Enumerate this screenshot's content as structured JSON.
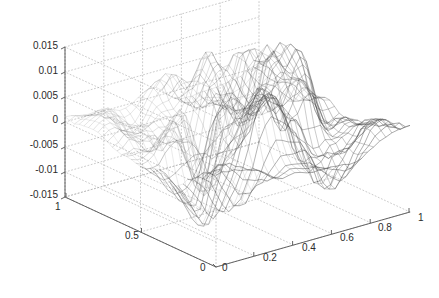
{
  "figure": {
    "background_color": "#ffffff",
    "width": 439,
    "height": 298,
    "title": ""
  },
  "axes": {
    "box_color": "#555555",
    "grid_color": "#b4b4b4",
    "grid_style": "dotted",
    "mesh_color": "#777777",
    "mesh_dark_color": "#333333"
  },
  "chart_data": {
    "type": "surface",
    "render": "mesh-wireframe",
    "title": "",
    "xlabel": "",
    "ylabel": "",
    "zlabel": "",
    "grid": true,
    "legend": null,
    "view": {
      "azimuth": -37.5,
      "elevation": 30
    },
    "xlim": [
      0,
      1
    ],
    "ylim": [
      0,
      1
    ],
    "zlim": [
      -0.015,
      0.015
    ],
    "xticks": [
      "0",
      "0.2",
      "0.4",
      "0.6",
      "0.8",
      "1"
    ],
    "xtick_values": [
      0,
      0.2,
      0.4,
      0.6,
      0.8,
      1
    ],
    "yticks": [
      "0",
      "0.5",
      "1"
    ],
    "ytick_values": [
      0,
      0.5,
      1
    ],
    "zticks": [
      "0.015",
      "0.01",
      "0.005",
      "0",
      "-0.005",
      "-0.01",
      "-0.015"
    ],
    "ztick_values": [
      0.015,
      0.01,
      0.005,
      0,
      -0.005,
      -0.01,
      -0.015
    ],
    "z_min": -0.013,
    "z_max": 0.015,
    "grid_n": 33,
    "seed": 20240517
  },
  "labels": {
    "z": [
      {
        "text": "0.015",
        "x": 58,
        "y": 40
      },
      {
        "text": "0.01",
        "x": 58,
        "y": 65
      },
      {
        "text": "0.005",
        "x": 58,
        "y": 90
      },
      {
        "text": "0",
        "x": 58,
        "y": 114
      },
      {
        "text": "-0.005",
        "x": 58,
        "y": 139
      },
      {
        "text": "-0.01",
        "x": 58,
        "y": 164
      },
      {
        "text": "-0.015",
        "x": 58,
        "y": 189
      }
    ],
    "y": [
      {
        "text": "1",
        "x": 55,
        "y": 201
      },
      {
        "text": "0.5",
        "x": 125,
        "y": 230
      },
      {
        "text": "0",
        "x": 200,
        "y": 262
      }
    ],
    "x": [
      {
        "text": "0",
        "x": 222,
        "y": 262
      },
      {
        "text": "0.2",
        "x": 263,
        "y": 252
      },
      {
        "text": "0.4",
        "x": 302,
        "y": 242
      },
      {
        "text": "0.6",
        "x": 340,
        "y": 232
      },
      {
        "text": "0.8",
        "x": 378,
        "y": 222
      },
      {
        "text": "1",
        "x": 418,
        "y": 212
      }
    ]
  }
}
